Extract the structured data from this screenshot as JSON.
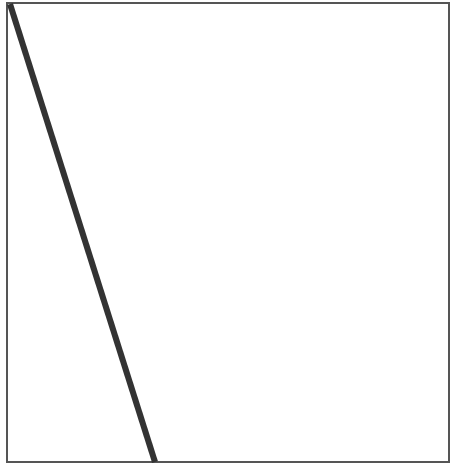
{
  "diagram": {
    "box": {
      "x": 7,
      "y": 3,
      "width": 442,
      "height": 459,
      "stroke": "#555555",
      "stroke_width": 2
    },
    "line": {
      "x1": 10,
      "y1": 4,
      "x2": 155,
      "y2": 462,
      "stroke": "#333333",
      "stroke_width": 6
    }
  }
}
